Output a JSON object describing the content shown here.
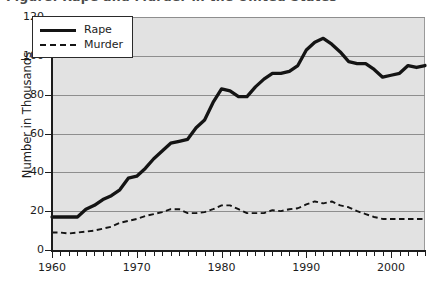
{
  "figure": {
    "title_cropped": "Figure: Rape and Murder in the United States",
    "background_color": "#e2e2e2",
    "gridline_color": "#8e8e8e",
    "axis_color": "#1c1c1c"
  },
  "legend": {
    "position": "top-left-inside",
    "entries": [
      {
        "label": "Rape",
        "style": "solid",
        "color": "#141414",
        "icon": "solid-line-swatch"
      },
      {
        "label": "Murder",
        "style": "dashed",
        "color": "#141414",
        "icon": "dashed-line-swatch"
      }
    ]
  },
  "axes": {
    "y_title": "Number in Thousands",
    "y_ticks": [
      "0",
      "20",
      "40",
      "60",
      "80",
      "100",
      "120"
    ],
    "x_ticks": [
      "1960",
      "1970",
      "1980",
      "1990",
      "2000"
    ]
  },
  "chart_data": {
    "type": "line",
    "title": "Figure: Rape and Murder in the United States",
    "xlabel": "",
    "ylabel": "Number in Thousands",
    "xlim": [
      1960,
      2004
    ],
    "ylim": [
      0,
      120
    ],
    "ytick_step": 20,
    "xtick_step_minor": 1,
    "xtick_step_major": 10,
    "grid": true,
    "legend_position": "upper left (inset box)",
    "x": [
      1960,
      1961,
      1962,
      1963,
      1964,
      1965,
      1966,
      1967,
      1968,
      1969,
      1970,
      1971,
      1972,
      1973,
      1974,
      1975,
      1976,
      1977,
      1978,
      1979,
      1980,
      1981,
      1982,
      1983,
      1984,
      1985,
      1986,
      1987,
      1988,
      1989,
      1990,
      1991,
      1992,
      1993,
      1994,
      1995,
      1996,
      1997,
      1998,
      1999,
      2000,
      2001,
      2002,
      2003,
      2004
    ],
    "series": [
      {
        "name": "Rape",
        "style": "solid",
        "color": "#141414",
        "values": [
          17,
          17,
          17,
          17,
          21,
          23,
          26,
          28,
          31,
          37,
          38,
          42,
          47,
          51,
          55,
          56,
          57,
          63,
          67,
          76,
          83,
          82,
          79,
          79,
          84,
          88,
          91,
          91,
          92,
          95,
          103,
          107,
          109,
          106,
          102,
          97,
          96,
          96,
          93,
          89,
          90,
          91,
          95,
          94,
          95
        ]
      },
      {
        "name": "Murder",
        "style": "dashed",
        "color": "#141414",
        "values": [
          9,
          9,
          8.5,
          9,
          9.5,
          10,
          11,
          12,
          14,
          15,
          16,
          17.5,
          18.5,
          19.5,
          21,
          21,
          19,
          19,
          19.5,
          21,
          23,
          23,
          21,
          19,
          19,
          19,
          20.5,
          20,
          21,
          21.5,
          23.5,
          25,
          24,
          25,
          23,
          22,
          20,
          18.5,
          17,
          16,
          16,
          16,
          16,
          16,
          16
        ]
      }
    ]
  }
}
